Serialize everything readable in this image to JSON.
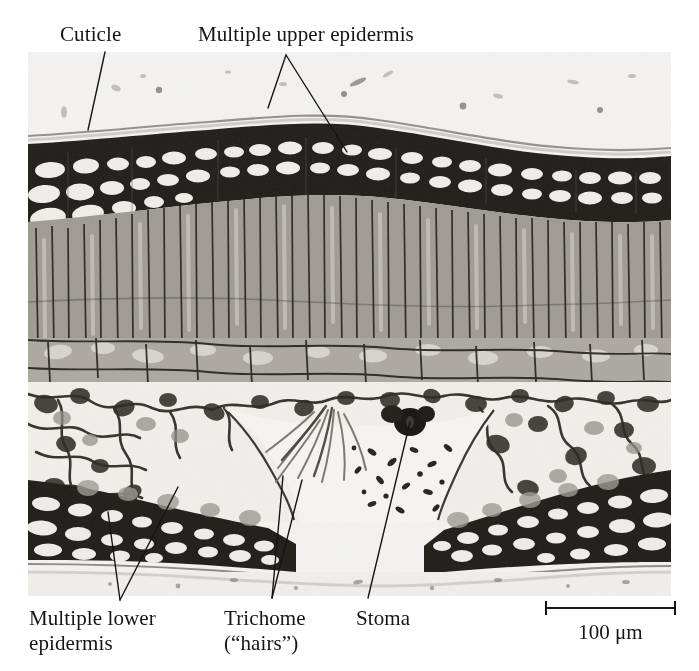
{
  "figure": {
    "type": "light-micrograph",
    "background_color": "#ffffff",
    "plate_color": "#f2f1ef",
    "ink_color": "#151515"
  },
  "labels": {
    "cuticle": "Cuticle",
    "upper_epidermis": "Multiple upper epidermis",
    "lower_epidermis": "Multiple lower\nepidermis",
    "trichome": "Trichome\n(“hairs”)",
    "stoma": "Stoma"
  },
  "scale_bar": {
    "text": "100 μm",
    "length_px": 131,
    "value": 100,
    "unit": "μm"
  },
  "leader_lines": [
    {
      "name": "cuticle-leader",
      "points": "105,52 88,130"
    },
    {
      "name": "upper-epidermis-leader-left",
      "points": "286,55 268,108"
    },
    {
      "name": "upper-epidermis-leader-right",
      "points": "286,55 347,152"
    },
    {
      "name": "lower-epidermis-leader-left",
      "points": "120,600 108,512"
    },
    {
      "name": "lower-epidermis-leader-right",
      "points": "120,600 178,487"
    },
    {
      "name": "trichome-leader-left",
      "points": "272,598 283,476"
    },
    {
      "name": "trichome-leader-right",
      "points": "272,598 302,480"
    },
    {
      "name": "stoma-leader",
      "points": "368,598 410,422"
    }
  ],
  "micrograph_regions": [
    {
      "name": "upper-cuticle",
      "depth_top": 0.0,
      "depth_bottom": 0.13
    },
    {
      "name": "multiple-upper-epidermis",
      "depth_top": 0.13,
      "depth_bottom": 0.25
    },
    {
      "name": "palisade-mesophyll",
      "depth_top": 0.25,
      "depth_bottom": 0.53
    },
    {
      "name": "spongy-mesophyll",
      "depth_top": 0.53,
      "depth_bottom": 0.84
    },
    {
      "name": "stomatal-crypt",
      "depth_top": 0.6,
      "depth_bottom": 0.86
    },
    {
      "name": "multiple-lower-epidermis",
      "depth_top": 0.82,
      "depth_bottom": 0.95
    },
    {
      "name": "lower-cuticle",
      "depth_top": 0.95,
      "depth_bottom": 1.0
    }
  ]
}
